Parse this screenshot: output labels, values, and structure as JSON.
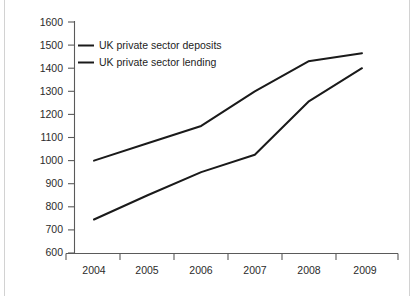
{
  "chart_data": {
    "type": "line",
    "title": "",
    "subtitle": "",
    "xlabel": "",
    "ylabel": "",
    "categories": [
      "2004",
      "2005",
      "2006",
      "2007",
      "2008",
      "2009"
    ],
    "x": [
      2004,
      2005,
      2006,
      2007,
      2008,
      2009
    ],
    "series": [
      {
        "name": "UK private sector deposits",
        "values": [
          1000,
          1075,
          1150,
          1300,
          1430,
          1465
        ],
        "color": "#1a1a1a"
      },
      {
        "name": "UK private sector lending",
        "values": [
          745,
          850,
          950,
          1025,
          1255,
          1400
        ],
        "color": "#1a1a1a"
      }
    ],
    "ylim": [
      600,
      1600
    ],
    "ytick_values": [
      600,
      700,
      800,
      900,
      1000,
      1100,
      1200,
      1300,
      1400,
      1500,
      1600
    ],
    "ytick_labels": [
      "600",
      "700",
      "800",
      "900",
      "1000",
      "1100",
      "1200",
      "1300",
      "1400",
      "1500",
      "1600"
    ],
    "xtick_labels": [
      "2004",
      "2005",
      "2006",
      "2007",
      "2008",
      "2009"
    ],
    "grid": false,
    "legend_position": "top-left-inside",
    "legend_entries": [
      "UK private sector deposits",
      "UK private sector lending"
    ]
  },
  "axes": {
    "y_axis_name": "value-axis",
    "x_axis_name": "year-axis"
  },
  "colors": {
    "background": "#ffffff",
    "axis": "#5a5a5a",
    "line": "#1a1a1a",
    "text": "#2b2b2b"
  }
}
